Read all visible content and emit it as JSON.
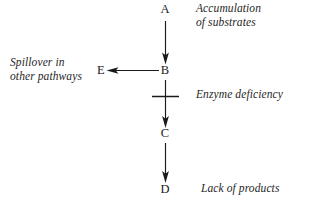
{
  "diagram": {
    "type": "metabolic-pathway-block",
    "background_color": "#ffffff",
    "ink_color": "#1a1a1a",
    "caption_color": "#262626",
    "nodes": [
      {
        "id": "A",
        "label": "A",
        "x": 165,
        "y": 9,
        "role": "substrate-upstream"
      },
      {
        "id": "B",
        "label": "B",
        "x": 165,
        "y": 70,
        "role": "accumulating-intermediate"
      },
      {
        "id": "C",
        "label": "C",
        "x": 165,
        "y": 133,
        "role": "downstream-intermediate"
      },
      {
        "id": "D",
        "label": "D",
        "x": 165,
        "y": 189,
        "role": "final-product"
      },
      {
        "id": "E",
        "label": "E",
        "x": 100,
        "y": 70,
        "role": "spillover-product"
      }
    ],
    "edges": [
      {
        "id": "a-to-b",
        "from": "A",
        "to": "B",
        "direction": "down",
        "blocked": false
      },
      {
        "id": "b-to-c",
        "from": "B",
        "to": "C",
        "direction": "down",
        "blocked": true
      },
      {
        "id": "c-to-d",
        "from": "C",
        "to": "D",
        "direction": "down",
        "blocked": false
      },
      {
        "id": "b-to-e",
        "from": "B",
        "to": "E",
        "direction": "left",
        "blocked": false
      }
    ],
    "block_marker": {
      "id": "enzyme-block-bar",
      "shape": "horizontal-crossbar",
      "x_start": 152,
      "x_end": 179,
      "y": 96,
      "meaning": "blocked enzymatic step"
    },
    "annotations": {
      "accumulation": "Accumulation\nof substrates",
      "spillover": "Spillover in\nother pathways",
      "enzyme_deficiency": "Enzyme deficiency",
      "lack_of_products": "Lack of products"
    }
  }
}
